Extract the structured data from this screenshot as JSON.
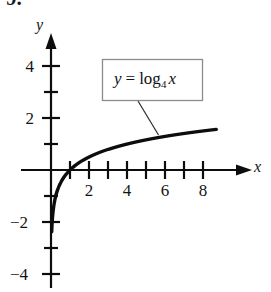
{
  "figure": {
    "problem_number": "9.",
    "axes": {
      "y_axis_label": "y",
      "x_axis_label": "x",
      "y_tick_labels": [
        "4",
        "2",
        "−2",
        "−4"
      ],
      "x_tick_labels": [
        "2",
        "4",
        "6",
        "8"
      ]
    },
    "callout": {
      "lhs": "y",
      "equals": "=",
      "function_name": "log",
      "base": "4",
      "argument": "x",
      "full_text": "y = log₄ x"
    },
    "colors": {
      "curve": "#0d0d0d",
      "axis": "#0d0d0d",
      "callout_border": "#8c8c8c",
      "background": "#ffffff"
    }
  },
  "chart_data": {
    "type": "line",
    "title": "",
    "xlabel": "x",
    "ylabel": "y",
    "xlim": [
      -1.2,
      9.5
    ],
    "ylim": [
      -4.6,
      4.8
    ],
    "grid": false,
    "legend": "none",
    "annotations": [
      {
        "text": "y = log₄ x",
        "kind": "boxed-callout",
        "points_to_x": 5.5,
        "points_to_y": 1.23
      }
    ],
    "x_ticks": [
      1,
      2,
      3,
      4,
      5,
      6,
      7,
      8
    ],
    "x_tick_labels": [
      "",
      "2",
      "",
      "4",
      "",
      "6",
      "",
      "8"
    ],
    "y_ticks": [
      -4,
      -3,
      -2,
      -1,
      1,
      2,
      3,
      4
    ],
    "y_tick_labels": [
      "−4",
      "",
      "−2",
      "",
      "",
      "2",
      "",
      "4"
    ],
    "series": [
      {
        "name": "y = log_4 x",
        "equation": "y = log(x)/log(4)",
        "x": [
          0.28,
          0.35,
          0.45,
          0.6,
          0.8,
          1.0,
          1.3,
          1.7,
          2.0,
          2.5,
          3.0,
          3.5,
          4.0,
          5.0,
          6.0,
          7.0,
          8.0,
          8.7
        ],
        "y": [
          -0.918,
          -0.757,
          -0.576,
          -0.368,
          -0.161,
          0.0,
          0.189,
          0.383,
          0.5,
          0.661,
          0.792,
          0.904,
          1.0,
          1.161,
          1.292,
          1.404,
          1.5,
          1.561
        ]
      }
    ]
  }
}
